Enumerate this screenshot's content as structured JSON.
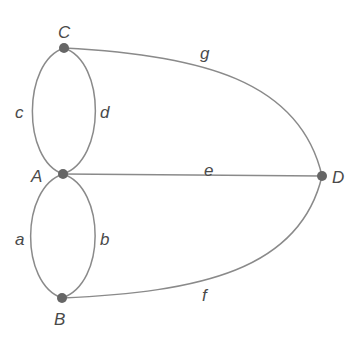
{
  "diagram": {
    "type": "graph",
    "colors": {
      "edge": "#8a8a8a",
      "node": "#666666",
      "label": "#4a4a4a",
      "background": "#ffffff"
    },
    "nodes": [
      {
        "id": "C",
        "label": "C",
        "x": 64,
        "y": 48
      },
      {
        "id": "A",
        "label": "A",
        "x": 63,
        "y": 174
      },
      {
        "id": "B",
        "label": "B",
        "x": 62,
        "y": 298
      },
      {
        "id": "D",
        "label": "D",
        "x": 322,
        "y": 176
      }
    ],
    "edges": [
      {
        "id": "c",
        "label": "c",
        "from": "C",
        "to": "A"
      },
      {
        "id": "d",
        "label": "d",
        "from": "C",
        "to": "A"
      },
      {
        "id": "a",
        "label": "a",
        "from": "A",
        "to": "B"
      },
      {
        "id": "b",
        "label": "b",
        "from": "A",
        "to": "B"
      },
      {
        "id": "g",
        "label": "g",
        "from": "C",
        "to": "D"
      },
      {
        "id": "e",
        "label": "e",
        "from": "A",
        "to": "D"
      },
      {
        "id": "f",
        "label": "f",
        "from": "B",
        "to": "D"
      }
    ]
  }
}
